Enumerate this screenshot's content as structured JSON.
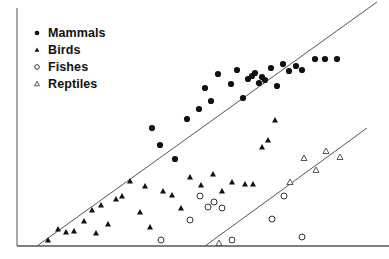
{
  "chart_data": {
    "type": "scatter",
    "title": "",
    "xlabel": "",
    "ylabel": "",
    "xlim": [
      0,
      389
    ],
    "ylim": [
      0,
      259
    ],
    "grid": false,
    "legend_position": "top-left",
    "axes": {
      "left_axis": {
        "x": 17,
        "y_top": 8,
        "y_bottom": 246
      },
      "bottom_axis": {
        "y": 246,
        "x_left": 17,
        "x_right": 389
      },
      "color": "#555555"
    },
    "legend": [
      {
        "label": "Mammals",
        "marker": "filled-circle"
      },
      {
        "label": "Birds",
        "marker": "filled-triangle"
      },
      {
        "label": "Fishes",
        "marker": "open-circle"
      },
      {
        "label": "Reptiles",
        "marker": "open-triangle"
      }
    ],
    "series": [
      {
        "name": "Mammals",
        "marker": "filled-circle",
        "color": "#111111",
        "points": [
          [
            199,
            109
          ],
          [
            205,
            88
          ],
          [
            211,
            101
          ],
          [
            218,
            74
          ],
          [
            231,
            84
          ],
          [
            237,
            70
          ],
          [
            243,
            98
          ],
          [
            248,
            79
          ],
          [
            252,
            76
          ],
          [
            255,
            73
          ],
          [
            259,
            83
          ],
          [
            262,
            77
          ],
          [
            265,
            80
          ],
          [
            271,
            68
          ],
          [
            277,
            86
          ],
          [
            283,
            64
          ],
          [
            289,
            71
          ],
          [
            296,
            66
          ],
          [
            302,
            70
          ],
          [
            315,
            59
          ],
          [
            325,
            59
          ],
          [
            337,
            59
          ],
          [
            175,
            159
          ],
          [
            152,
            128
          ],
          [
            160,
            145
          ],
          [
            187,
            119
          ]
        ]
      },
      {
        "name": "Birds",
        "marker": "filled-triangle",
        "color": "#111111",
        "points": [
          [
            48,
            240
          ],
          [
            58,
            229
          ],
          [
            66,
            232
          ],
          [
            74,
            231
          ],
          [
            84,
            221
          ],
          [
            92,
            210
          ],
          [
            96,
            233
          ],
          [
            101,
            205
          ],
          [
            108,
            224
          ],
          [
            116,
            199
          ],
          [
            122,
            196
          ],
          [
            130,
            181
          ],
          [
            140,
            212
          ],
          [
            145,
            186
          ],
          [
            150,
            227
          ],
          [
            163,
            191
          ],
          [
            172,
            195
          ],
          [
            181,
            208
          ],
          [
            190,
            177
          ],
          [
            201,
            185
          ],
          [
            213,
            174
          ],
          [
            222,
            191
          ],
          [
            232,
            182
          ],
          [
            245,
            184
          ],
          [
            253,
            184
          ],
          [
            262,
            147
          ],
          [
            268,
            140
          ],
          [
            275,
            120
          ]
        ]
      },
      {
        "name": "Fishes",
        "marker": "open-circle",
        "color": "#333333",
        "points": [
          [
            161,
            240
          ],
          [
            190,
            220
          ],
          [
            200,
            196
          ],
          [
            208,
            207
          ],
          [
            214,
            202
          ],
          [
            222,
            208
          ],
          [
            232,
            240
          ],
          [
            272,
            219
          ],
          [
            284,
            196
          ],
          [
            302,
            237
          ]
        ]
      },
      {
        "name": "Reptiles",
        "marker": "open-triangle",
        "color": "#555555",
        "points": [
          [
            219,
            243
          ],
          [
            290,
            182
          ],
          [
            304,
            158
          ],
          [
            316,
            170
          ],
          [
            326,
            151
          ],
          [
            340,
            157
          ]
        ]
      }
    ],
    "trend_lines": [
      {
        "name": "upper-regression-line",
        "x1": 37,
        "y1": 246,
        "x2": 377,
        "y2": 2,
        "color": "#555555"
      },
      {
        "name": "lower-regression-line",
        "x1": 205,
        "y1": 246,
        "x2": 367,
        "y2": 128,
        "color": "#555555"
      }
    ]
  }
}
